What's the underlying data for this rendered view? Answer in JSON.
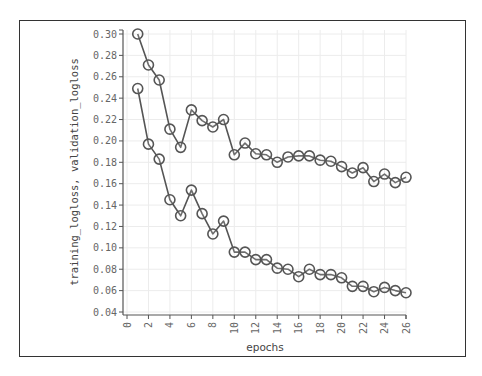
{
  "chart_data": {
    "type": "line",
    "title": "",
    "xlabel": "epochs",
    "ylabel": "training_logloss, validation_logloss",
    "xlim": [
      0,
      26
    ],
    "ylim": [
      0.04,
      0.3
    ],
    "grid": true,
    "legend": null,
    "x_ticks": [
      "0",
      "2",
      "4",
      "6",
      "8",
      "10",
      "12",
      "14",
      "16",
      "18",
      "20",
      "22",
      "24",
      "26"
    ],
    "y_ticks": [
      "0.30",
      "0.28",
      "0.26",
      "0.24",
      "0.22",
      "0.20",
      "0.18",
      "0.16",
      "0.14",
      "0.12",
      "0.10",
      "0.08",
      "0.06",
      "0.04"
    ],
    "x": [
      1,
      2,
      3,
      4,
      5,
      6,
      7,
      8,
      9,
      10,
      11,
      12,
      13,
      14,
      15,
      16,
      17,
      18,
      19,
      20,
      21,
      22,
      23,
      24,
      25,
      26
    ],
    "series": [
      {
        "name": "validation_logloss",
        "marker": "hollow-circle",
        "values": [
          0.3,
          0.271,
          0.257,
          0.211,
          0.194,
          0.229,
          0.219,
          0.213,
          0.22,
          0.187,
          0.198,
          0.188,
          0.187,
          0.18,
          0.185,
          0.186,
          0.186,
          0.182,
          0.181,
          0.176,
          0.17,
          0.175,
          0.162,
          0.169,
          0.161,
          0.166
        ]
      },
      {
        "name": "training_logloss",
        "marker": "hollow-circle",
        "values": [
          0.249,
          0.197,
          0.183,
          0.145,
          0.13,
          0.154,
          0.132,
          0.113,
          0.125,
          0.096,
          0.096,
          0.089,
          0.089,
          0.081,
          0.08,
          0.073,
          0.08,
          0.075,
          0.075,
          0.072,
          0.064,
          0.064,
          0.059,
          0.063,
          0.06,
          0.058
        ]
      }
    ]
  },
  "colors": {
    "line": "#555555",
    "grid": "#ececec",
    "axis": "#555555",
    "frame": "#333333"
  }
}
